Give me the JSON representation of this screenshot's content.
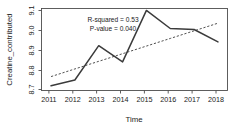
{
  "chart_data": {
    "type": "line",
    "title": "",
    "xlabel": "Time",
    "ylabel": "Creatine_contributed",
    "x": [
      2011,
      2012,
      2013,
      2014,
      2015,
      2016,
      2017,
      2018
    ],
    "xtick_labels": [
      "2011",
      "2012",
      "2013",
      "2014",
      "2015",
      "2016",
      "2017",
      "2018"
    ],
    "ytick_labels": [
      "8.7",
      "8.8",
      "8.9",
      "9.0",
      "9.1"
    ],
    "ytick_values": [
      8.7,
      8.8,
      8.9,
      9.0,
      9.1
    ],
    "xlim": [
      2010.6,
      2018.4
    ],
    "ylim": [
      8.68,
      9.11
    ],
    "grid": false,
    "legend": "none",
    "series": [
      {
        "name": "Creatine_contributed",
        "style": "solid",
        "values": [
          8.705,
          8.735,
          8.915,
          8.83,
          9.1,
          9.005,
          9.0,
          8.935
        ]
      },
      {
        "name": "trend",
        "style": "dashed",
        "values": [
          8.753,
          8.793,
          8.833,
          8.873,
          8.913,
          8.953,
          8.993,
          9.033
        ]
      }
    ],
    "annotations": [
      {
        "name": "r-squared",
        "text": "R-squared = 0.53",
        "x": 2013.2,
        "y": 9.05
      },
      {
        "name": "p-value",
        "text": "P-value = 0.040",
        "x": 2013.2,
        "y": 9.015
      }
    ],
    "stats": {
      "r_squared": 0.53,
      "p_value": 0.04
    },
    "colors": {
      "data_line": "#3b3b3b",
      "trend_line": "#3b3b3b",
      "axis": "#4d4d4d",
      "text": "#1a1a1a",
      "background": "#ffffff"
    }
  }
}
